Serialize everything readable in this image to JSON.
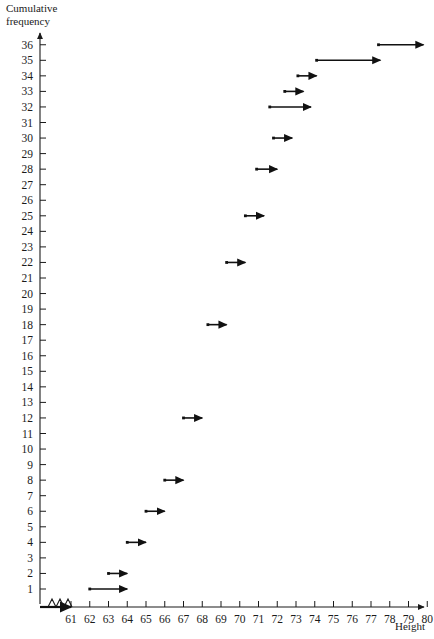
{
  "chart_data": {
    "type": "line",
    "title": "",
    "subtitle": "",
    "xlabel": "Height",
    "ylabel": "Cumulative frequency",
    "ylabel_line1": "Cumulative",
    "ylabel_line2": "frequency",
    "xlim": [
      60.4,
      80.8
    ],
    "ylim": [
      0,
      36.6
    ],
    "grid": false,
    "legend": null,
    "axis_break_y": true,
    "x_ticks": [
      61,
      62,
      63,
      64,
      65,
      66,
      67,
      68,
      69,
      70,
      71,
      72,
      73,
      74,
      75,
      76,
      77,
      78,
      79,
      80
    ],
    "x_tick_labels": [
      "61",
      "62",
      "63",
      "64",
      "65",
      "66",
      "67",
      "68",
      "69",
      "70",
      "71",
      "72",
      "73",
      "74",
      "75",
      "76",
      "77",
      "78",
      "79",
      "80"
    ],
    "y_ticks": [
      1,
      2,
      3,
      4,
      5,
      6,
      7,
      8,
      9,
      10,
      11,
      12,
      13,
      14,
      15,
      16,
      17,
      18,
      19,
      20,
      21,
      22,
      23,
      24,
      25,
      26,
      27,
      28,
      29,
      30,
      31,
      32,
      33,
      34,
      35,
      36
    ],
    "y_tick_labels": [
      "1",
      "2",
      "3",
      "4",
      "5",
      "6",
      "7",
      "8",
      "9",
      "10",
      "11",
      "12",
      "13",
      "14",
      "15",
      "16",
      "17",
      "18",
      "19",
      "20",
      "21",
      "22",
      "23",
      "24",
      "25",
      "26",
      "27",
      "28",
      "29",
      "30",
      "31",
      "32",
      "33",
      "34",
      "35",
      "36"
    ],
    "series_color": "#111111",
    "step_segments": [
      {
        "cf": 1,
        "x_start": 62.0,
        "x_end": 64.0,
        "arrow": "right"
      },
      {
        "cf": 2,
        "x_start": 63.0,
        "x_end": 64.0,
        "arrow": "right"
      },
      {
        "cf": 4,
        "x_start": 64.0,
        "x_end": 65.0,
        "arrow": "right"
      },
      {
        "cf": 6,
        "x_start": 65.0,
        "x_end": 66.0,
        "arrow": "right"
      },
      {
        "cf": 8,
        "x_start": 66.0,
        "x_end": 67.0,
        "arrow": "right"
      },
      {
        "cf": 12,
        "x_start": 67.0,
        "x_end": 68.0,
        "arrow": "right"
      },
      {
        "cf": 18,
        "x_start": 68.3,
        "x_end": 69.3,
        "arrow": "right"
      },
      {
        "cf": 22,
        "x_start": 69.3,
        "x_end": 70.3,
        "arrow": "right"
      },
      {
        "cf": 25,
        "x_start": 70.3,
        "x_end": 71.3,
        "arrow": "right"
      },
      {
        "cf": 28,
        "x_start": 70.9,
        "x_end": 72.0,
        "arrow": "right"
      },
      {
        "cf": 30,
        "x_start": 71.8,
        "x_end": 72.8,
        "arrow": "right"
      },
      {
        "cf": 32,
        "x_start": 71.6,
        "x_end": 73.8,
        "arrow": "right"
      },
      {
        "cf": 33,
        "x_start": 72.4,
        "x_end": 73.4,
        "arrow": "right"
      },
      {
        "cf": 34,
        "x_start": 73.1,
        "x_end": 74.1,
        "arrow": "right"
      },
      {
        "cf": 35,
        "x_start": 74.1,
        "x_end": 77.5,
        "arrow": "right"
      },
      {
        "cf": 36,
        "x_start": 77.4,
        "x_end": 79.8,
        "arrow": "right"
      }
    ]
  }
}
